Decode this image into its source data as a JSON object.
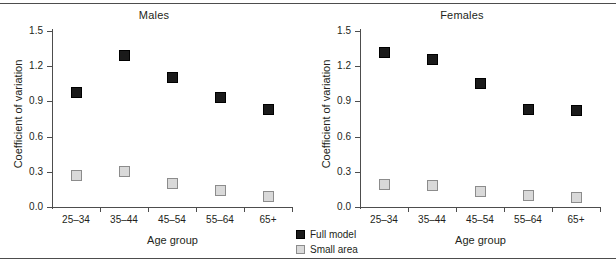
{
  "chart_data": {
    "type": "scatter",
    "title": "",
    "categories": [
      "25–34",
      "35–44",
      "45–54",
      "55–64",
      "65+"
    ],
    "xlabel": "Age group",
    "ylabel": "Coefficient of variation",
    "ylim": [
      0.0,
      1.5
    ],
    "yticks": [
      "0.0",
      "0.3",
      "0.6",
      "0.9",
      "1.2",
      "1.5"
    ],
    "ytick_values": [
      0.0,
      0.3,
      0.6,
      0.9,
      1.2,
      1.5
    ],
    "grid": false,
    "legend_position": "bottom-center",
    "panels": [
      {
        "title": "Males",
        "series": [
          {
            "name": "Full model",
            "color": "#1a1a1a",
            "values": [
              0.98,
              1.29,
              1.1,
              0.93,
              0.83
            ]
          },
          {
            "name": "Small area",
            "color": "#d9d9d9",
            "values": [
              0.27,
              0.3,
              0.2,
              0.14,
              0.09
            ]
          }
        ]
      },
      {
        "title": "Females",
        "series": [
          {
            "name": "Full model",
            "color": "#1a1a1a",
            "values": [
              1.32,
              1.26,
              1.05,
              0.83,
              0.82
            ]
          },
          {
            "name": "Small area",
            "color": "#d9d9d9",
            "values": [
              0.19,
              0.18,
              0.13,
              0.1,
              0.08
            ]
          }
        ]
      }
    ],
    "legend": [
      {
        "label": "Full model",
        "swatch": "filled-black-square"
      },
      {
        "label": "Small area",
        "swatch": "light-gray-square"
      }
    ]
  }
}
